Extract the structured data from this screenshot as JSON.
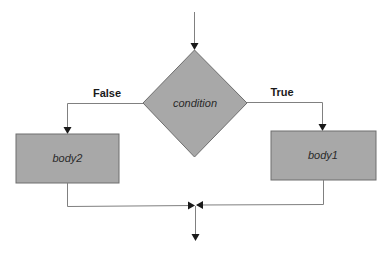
{
  "diagram": {
    "type": "flowchart",
    "colors": {
      "shape_fill": "#a8a8a8",
      "shape_stroke": "#6e6e6e",
      "line": "#808080",
      "arrow": "#1a1a1a",
      "background": "#ffffff"
    },
    "nodes": {
      "condition": {
        "shape": "diamond",
        "label": "condition"
      },
      "body1": {
        "shape": "rectangle",
        "label": "body1"
      },
      "body2": {
        "shape": "rectangle",
        "label": "body2"
      }
    },
    "edges": {
      "entry": {
        "from": "start",
        "to": "condition",
        "label": ""
      },
      "false_branch": {
        "from": "condition",
        "to": "body2",
        "label": "False"
      },
      "true_branch": {
        "from": "condition",
        "to": "body1",
        "label": "True"
      },
      "body2_merge": {
        "from": "body2",
        "to": "merge",
        "label": ""
      },
      "body1_merge": {
        "from": "body1",
        "to": "merge",
        "label": ""
      },
      "exit": {
        "from": "merge",
        "to": "end",
        "label": ""
      }
    }
  }
}
